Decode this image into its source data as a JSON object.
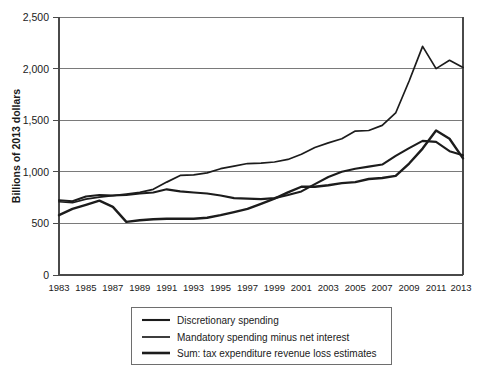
{
  "chart_data": {
    "type": "line",
    "title": "",
    "subtitle": "",
    "xlabel": "",
    "ylabel": "Billions of 2013 dollars",
    "xlim": [
      1983,
      2013
    ],
    "ylim": [
      0,
      2500
    ],
    "grid": true,
    "grid_axis": "y",
    "legend_position": "bottom",
    "yticks": [
      0,
      500,
      1000,
      1500,
      2000,
      2500
    ],
    "ytick_labels": [
      "0",
      "500",
      "1,000",
      "1,500",
      "2,000",
      "2,500"
    ],
    "xticks": [
      1983,
      1985,
      1987,
      1989,
      1991,
      1993,
      1995,
      1997,
      1999,
      2001,
      2003,
      2005,
      2007,
      2009,
      2011,
      2013
    ],
    "xtick_labels": [
      "1983",
      "1985",
      "1987",
      "1989",
      "1991",
      "1993",
      "1995",
      "1997",
      "1999",
      "2001",
      "2003",
      "2005",
      "2007",
      "2009",
      "2011",
      "2013"
    ],
    "x": [
      1983,
      1984,
      1985,
      1986,
      1987,
      1988,
      1989,
      1990,
      1991,
      1992,
      1993,
      1994,
      1995,
      1996,
      1997,
      1998,
      1999,
      2000,
      2001,
      2002,
      2003,
      2004,
      2005,
      2006,
      2007,
      2008,
      2009,
      2010,
      2011,
      2012,
      2013
    ],
    "series": [
      {
        "name": "Discretionary spending",
        "color": "#1c1c1c",
        "values": [
          725,
          715,
          760,
          775,
          770,
          775,
          790,
          800,
          830,
          810,
          800,
          790,
          770,
          745,
          740,
          735,
          745,
          775,
          810,
          880,
          950,
          1000,
          1030,
          1050,
          1070,
          1155,
          1230,
          1300,
          1290,
          1200,
          1160
        ]
      },
      {
        "name": "Mandatory spending minus net interest",
        "color": "#1c1c1c",
        "values": [
          710,
          700,
          735,
          755,
          770,
          785,
          800,
          830,
          900,
          965,
          970,
          990,
          1030,
          1055,
          1080,
          1085,
          1095,
          1120,
          1170,
          1235,
          1280,
          1320,
          1395,
          1400,
          1450,
          1570,
          1880,
          2215,
          2000,
          2080,
          2010
        ]
      },
      {
        "name": "Sum: tax expenditure revenue loss estimates",
        "color": "#1c1c1c",
        "values": [
          580,
          640,
          680,
          720,
          660,
          515,
          530,
          540,
          545,
          545,
          545,
          555,
          580,
          610,
          640,
          690,
          740,
          800,
          855,
          855,
          870,
          890,
          900,
          930,
          940,
          960,
          1080,
          1225,
          1400,
          1320,
          1130
        ]
      }
    ],
    "legend_entries": [
      "Discretionary spending",
      "Mandatory spending minus net interest",
      "Sum: tax expenditure revenue loss estimates"
    ]
  }
}
